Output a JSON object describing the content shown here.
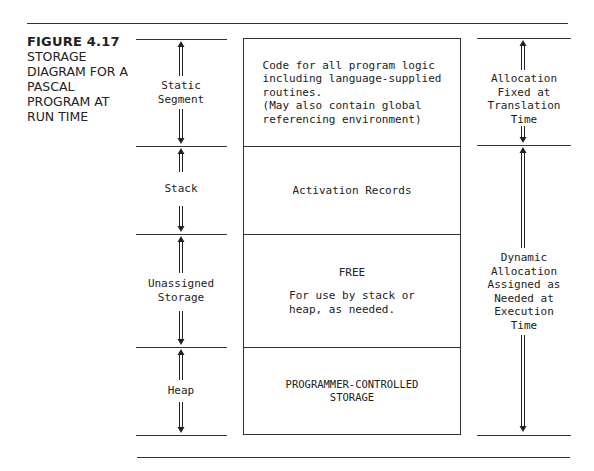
{
  "figure": {
    "number": "FIGURE 4.17",
    "title_lines": [
      "STORAGE",
      "DIAGRAM FOR A",
      "PASCAL",
      "PROGRAM AT",
      "RUN TIME"
    ]
  },
  "left_labels": [
    {
      "lines": [
        "Static",
        "Segment"
      ]
    },
    {
      "lines": [
        "Stack"
      ]
    },
    {
      "lines": [
        "Unassigned",
        "Storage"
      ]
    },
    {
      "lines": [
        "Heap"
      ]
    }
  ],
  "center_cells": [
    {
      "lines": [
        "Code for all program logic",
        "including language-supplied",
        "routines.",
        "(May also contain global",
        "referencing environment)"
      ],
      "align": "left"
    },
    {
      "lines": [
        "Activation Records"
      ],
      "align": "center"
    },
    {
      "heading": "FREE",
      "lines": [
        "For use by stack or",
        "heap, as needed."
      ],
      "align": "left"
    },
    {
      "lines": [
        "PROGRAMMER-CONTROLLED",
        "STORAGE"
      ],
      "align": "center"
    }
  ],
  "right_labels": [
    {
      "lines": [
        "Allocation",
        "Fixed at",
        "Translation",
        "Time"
      ]
    },
    {
      "lines": [
        "Dynamic",
        "Allocation",
        "Assigned as",
        "Needed at",
        "Execution",
        "Time"
      ]
    }
  ],
  "colors": {
    "line": "#333333",
    "text": "#222222",
    "background": "#ffffff"
  }
}
